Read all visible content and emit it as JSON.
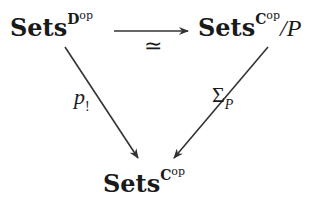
{
  "diagram": {
    "type": "commutative-triangle",
    "nodes": {
      "top_left": {
        "base": "Sets",
        "sup_letter": "D",
        "sup_op": "op"
      },
      "top_right": {
        "base": "Sets",
        "sup_letter": "C",
        "sup_op": "op",
        "suffix": "/P"
      },
      "bottom": {
        "base": "Sets",
        "sup_letter": "C",
        "sup_op": "op"
      }
    },
    "arrows": [
      {
        "from": "top_left",
        "to": "top_right",
        "label": "≃"
      },
      {
        "from": "top_left",
        "to": "bottom",
        "label_main": "p",
        "label_sub": "!"
      },
      {
        "from": "top_right",
        "to": "bottom",
        "label_main": "Σ",
        "label_sub": "P"
      }
    ],
    "colors": {
      "stroke": "#333333",
      "text": "#1a1a1a",
      "background": "#ffffff"
    }
  }
}
